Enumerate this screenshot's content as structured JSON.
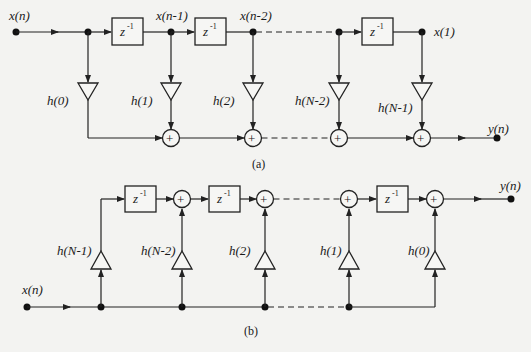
{
  "figure": {
    "panel_a": {
      "caption": "(a)",
      "title": "FIR direct form",
      "input_label": "x(n)",
      "output_label": "y(n)",
      "delay_label": "z",
      "delay_exp": "-1",
      "tap_labels": [
        "x(n-1)",
        "x(n-2)",
        "x(1)"
      ],
      "coefficients": [
        "h(0)",
        "h(1)",
        "h(2)",
        "h(N-2)",
        "h(N-1)"
      ],
      "adder_symbol": "+"
    },
    "panel_b": {
      "caption": "(b)",
      "title": "FIR transposed form",
      "input_label": "x(n)",
      "output_label": "y(n)",
      "delay_label": "z",
      "delay_exp": "-1",
      "coefficients": [
        "h(N-1)",
        "h(N-2)",
        "h(2)",
        "h(1)",
        "h(0)"
      ],
      "adder_symbol": "+"
    }
  }
}
